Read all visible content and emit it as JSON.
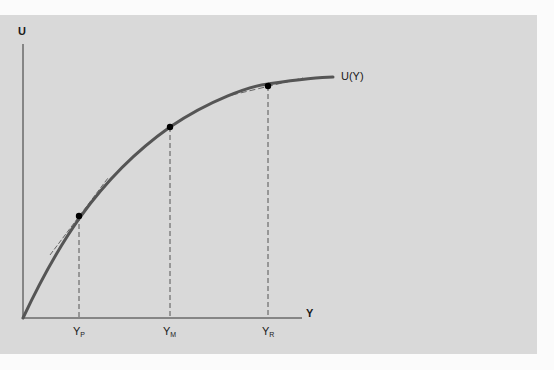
{
  "figure": {
    "y_axis_label": "U",
    "x_axis_label": "Y",
    "curve_label": "U(Y)",
    "ticks": [
      {
        "main": "Y",
        "sub": "P"
      },
      {
        "main": "Y",
        "sub": "M"
      },
      {
        "main": "Y",
        "sub": "R"
      }
    ],
    "colors": {
      "background_panel": "#d9d9d9",
      "curve": "#555555",
      "axes": "#333333",
      "points": "#000000"
    }
  }
}
